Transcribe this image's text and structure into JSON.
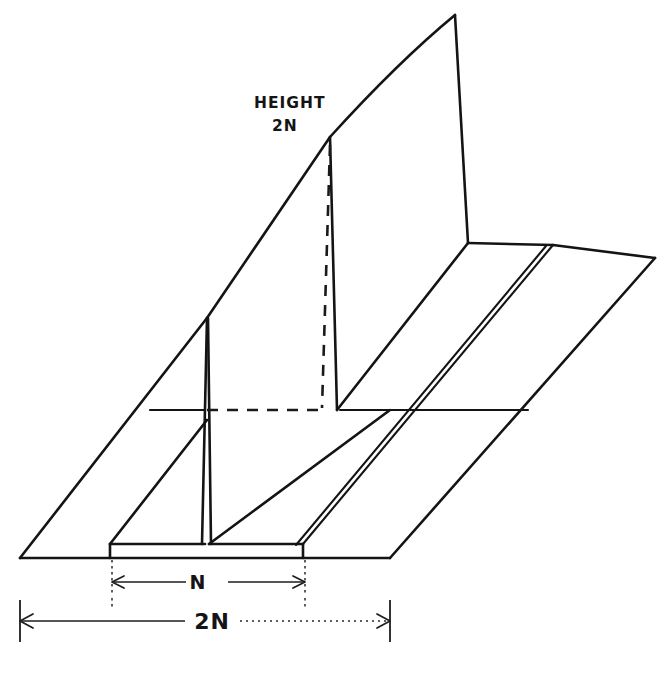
{
  "figure": {
    "style": "hand-drawn technical line drawing",
    "background_color": "#ffffff",
    "line_color": "#141414"
  },
  "annotations": {
    "height_label_line1": "HEIGHT",
    "height_label_line2": "2N",
    "dimension_inner": "N",
    "dimension_outer": "2N"
  },
  "icons": {
    "arrow_left": "arrow-left-icon",
    "arrow_right": "arrow-right-icon"
  },
  "geometry": {
    "blade_apex": "207,318",
    "crest_peak": "455,15",
    "wall_top_front": "330,137",
    "base_front_left": "20,558",
    "base_front_right": "390,558",
    "base_back_right": "655,258",
    "channel_left_step": "110,544",
    "channel_right_step": "303,544"
  },
  "dimensions": {
    "inner_line_y": 582,
    "inner_from_x": 112,
    "inner_to_x": 305,
    "outer_line_y": 621,
    "outer_from_x": 20,
    "outer_to_x": 390
  }
}
